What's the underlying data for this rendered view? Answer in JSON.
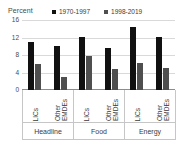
{
  "chart_data": {
    "type": "bar",
    "title": "",
    "subtitle": "",
    "xlabel": "",
    "ylabel": "Percent",
    "ylim": [
      0,
      16
    ],
    "yticks": [
      0,
      4,
      8,
      12,
      16
    ],
    "grid": true,
    "legend_position": "top",
    "categories": [
      "Headline LICs",
      "Headline Other EMDEs",
      "Food LICs",
      "Food Other EMDEs",
      "Energy LICs",
      "Energy Other EMDEs"
    ],
    "groups": [
      {
        "label": "Headline",
        "subcategories": [
          {
            "label": "LICs",
            "values": [
              11.0,
              6.0
            ]
          },
          {
            "label": "Other\nEMDEs",
            "values": [
              10.1,
              3.0
            ]
          }
        ]
      },
      {
        "label": "Food",
        "subcategories": [
          {
            "label": "LICs",
            "values": [
              12.1,
              7.8
            ]
          },
          {
            "label": "Other\nEMDEs",
            "values": [
              9.6,
              4.8
            ]
          }
        ]
      },
      {
        "label": "Energy",
        "subcategories": [
          {
            "label": "LICs",
            "values": [
              14.3,
              6.2
            ]
          },
          {
            "label": "Other\nEMDEs",
            "values": [
              12.1,
              5.0
            ]
          }
        ]
      }
    ],
    "series": [
      {
        "name": "1970-1997",
        "color": "#111111",
        "values": [
          11.0,
          10.1,
          12.1,
          9.6,
          14.3,
          12.1
        ]
      },
      {
        "name": "1998-2019",
        "color": "#4f4f4f",
        "values": [
          6.0,
          3.0,
          7.8,
          4.8,
          6.2,
          5.0
        ]
      }
    ]
  },
  "axis": {
    "unit_label": "Percent"
  },
  "colors": {
    "series_1970_1997": "#111111",
    "series_1998_2019": "#4f4f4f",
    "gridline": "#d9d9d9",
    "border": "#c6c6c6",
    "text": "#3b3b3b"
  }
}
